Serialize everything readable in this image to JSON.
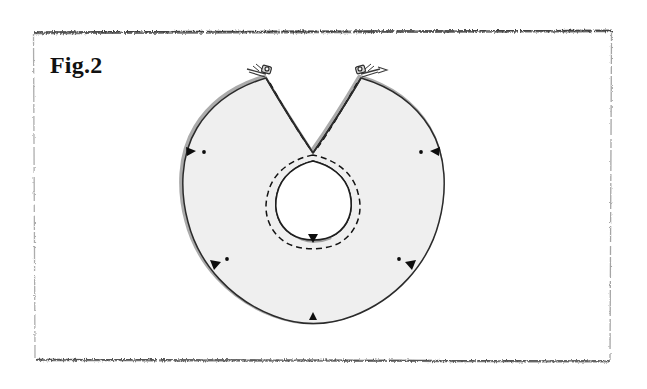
{
  "page": {
    "width": 647,
    "height": 389,
    "background_color": "#ffffff",
    "kind": "scanned-patent-figure"
  },
  "figure": {
    "label": "Fig.2",
    "caption": "",
    "colors": {
      "paper": "#ffffff",
      "fabric_fill": "#efefef",
      "outline": "#2b2b2b",
      "seam_shadow": "#8c8c8c",
      "stitch_dashed": "#1a1a1a",
      "notch_marker": "#000000",
      "frame_rule": "#7a7a7a"
    },
    "frame": {
      "top_y": 32,
      "bottom_y": 360,
      "left_x": 33,
      "right_x": 611,
      "style": "noisy-scan-rule"
    },
    "shape": {
      "name": "open-ring-collar",
      "outer_center_x": 313,
      "outer_center_y": 200,
      "outer_radius_x": 125,
      "outer_radius_y": 133,
      "inner_hole_center_x": 313,
      "inner_hole_center_y": 200,
      "inner_hole_radius_x": 36,
      "inner_hole_radius_y": 38,
      "opening_angle_label": "V-notch opening at top",
      "opening_apex_x": 313,
      "opening_apex_y": 153
    },
    "details": [
      {
        "id": "clasp-left",
        "type": "hook-and-eye-clasp",
        "x": 262,
        "y": 70,
        "label": "hook clasp (left point)"
      },
      {
        "id": "clasp-right",
        "type": "hook-and-eye-clasp",
        "x": 364,
        "y": 70,
        "label": "eye clasp (right point)"
      },
      {
        "id": "stitch-outer",
        "type": "dashed-stitch-line",
        "label": "dashed stitching line around neck opening"
      },
      {
        "id": "stitch-left",
        "type": "dashed-stitch-line",
        "label": "dashed stitching line along left opening edge"
      },
      {
        "id": "stitch-right",
        "type": "dashed-stitch-line",
        "label": "dashed stitching line along right opening edge"
      }
    ],
    "markers": [
      {
        "id": "notch-left-upper",
        "type": "notch-triangle",
        "x": 191,
        "y": 150,
        "dot_x": 204,
        "dot_y": 152
      },
      {
        "id": "notch-right-upper",
        "type": "notch-triangle",
        "x": 434,
        "y": 150,
        "dot_x": 421,
        "dot_y": 152
      },
      {
        "id": "notch-left-lower",
        "type": "notch-triangle",
        "x": 215,
        "y": 264,
        "dot_x": 226,
        "dot_y": 260
      },
      {
        "id": "notch-right-lower",
        "type": "notch-triangle",
        "x": 411,
        "y": 264,
        "dot_x": 400,
        "dot_y": 260
      },
      {
        "id": "notch-bottom-center",
        "type": "notch-triangle",
        "x": 313,
        "y": 318,
        "dot_x": null,
        "dot_y": null
      },
      {
        "id": "notch-inner-bottom",
        "type": "notch-triangle",
        "x": 313,
        "y": 238,
        "dot_x": null,
        "dot_y": null
      }
    ]
  }
}
